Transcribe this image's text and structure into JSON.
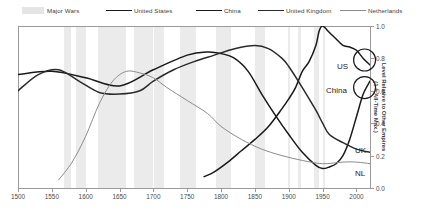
{
  "legend": {
    "items": [
      {
        "label": "Major Wars",
        "kind": "band",
        "color": "#e5e5e5"
      },
      {
        "label": "United States",
        "kind": "line",
        "color": "#1a1a1a",
        "width": 1.6
      },
      {
        "label": "China",
        "kind": "line",
        "color": "#1a1a1a",
        "width": 1.3
      },
      {
        "label": "United Kingdom",
        "kind": "line",
        "color": "#2b2b2b",
        "width": 1.4
      },
      {
        "label": "Netherlands",
        "kind": "line",
        "color": "#8c8c8c",
        "width": 1.0
      }
    ]
  },
  "axes": {
    "x_ticks": [
      "1500",
      "1550",
      "1600",
      "1650",
      "1700",
      "1750",
      "1800",
      "1850",
      "1900",
      "1950",
      "2000"
    ],
    "y_ticks": [
      "0.0",
      "0.2",
      "0.4",
      "0.6",
      "0.8",
      "1.0"
    ],
    "y_title_line1": "Level Relative to Other Empires",
    "y_title_line2": "(1 = All-Time Max.)"
  },
  "end_labels": [
    {
      "name": "US",
      "text": "US"
    },
    {
      "name": "China",
      "text": "China"
    },
    {
      "name": "UK",
      "text": "UK"
    },
    {
      "name": "NL",
      "text": "NL"
    }
  ],
  "chart_data": {
    "type": "line",
    "title": "",
    "xlabel": "",
    "ylabel": "Level Relative to Other Empires (1 = All-Time Max.)",
    "xlim": [
      1500,
      2020
    ],
    "ylim": [
      0.0,
      1.0
    ],
    "grid": false,
    "legend_position": "top",
    "shaded_bands": {
      "label": "Major Wars",
      "color": "#ebebeb",
      "ranges": [
        [
          1568,
          1578
        ],
        [
          1585,
          1600
        ],
        [
          1618,
          1660
        ],
        [
          1672,
          1700
        ],
        [
          1701,
          1715
        ],
        [
          1740,
          1763
        ],
        [
          1792,
          1815
        ],
        [
          1850,
          1865
        ],
        [
          1899,
          1902
        ],
        [
          1914,
          1918
        ],
        [
          1937,
          1945
        ],
        [
          1950,
          1953
        ]
      ]
    },
    "series": [
      {
        "name": "United States",
        "color": "#1a1a1a",
        "x": [
          1775,
          1790,
          1810,
          1830,
          1850,
          1870,
          1890,
          1900,
          1910,
          1920,
          1930,
          1940,
          1945,
          1950,
          1960,
          1970,
          1980,
          1990,
          2000,
          2010,
          2020
        ],
        "y": [
          0.07,
          0.1,
          0.16,
          0.23,
          0.3,
          0.38,
          0.49,
          0.55,
          0.62,
          0.72,
          0.78,
          0.88,
          0.97,
          1.0,
          0.96,
          0.92,
          0.88,
          0.87,
          0.85,
          0.8,
          0.76
        ]
      },
      {
        "name": "China",
        "color": "#1a1a1a",
        "x": [
          1500,
          1550,
          1600,
          1650,
          1700,
          1750,
          1780,
          1800,
          1820,
          1840,
          1860,
          1880,
          1900,
          1920,
          1940,
          1950,
          1960,
          1970,
          1980,
          1990,
          2000,
          2010,
          2020
        ],
        "y": [
          0.7,
          0.72,
          0.68,
          0.63,
          0.73,
          0.82,
          0.84,
          0.83,
          0.8,
          0.72,
          0.58,
          0.45,
          0.33,
          0.22,
          0.14,
          0.12,
          0.13,
          0.15,
          0.2,
          0.3,
          0.44,
          0.58,
          0.66
        ]
      },
      {
        "name": "United Kingdom",
        "color": "#2b2b2b",
        "x": [
          1500,
          1530,
          1560,
          1590,
          1620,
          1650,
          1680,
          1700,
          1730,
          1760,
          1790,
          1820,
          1850,
          1870,
          1890,
          1900,
          1920,
          1940,
          1950,
          1960,
          1980,
          2000,
          2020
        ],
        "y": [
          0.6,
          0.7,
          0.73,
          0.66,
          0.59,
          0.58,
          0.6,
          0.66,
          0.73,
          0.78,
          0.82,
          0.86,
          0.88,
          0.86,
          0.8,
          0.75,
          0.62,
          0.48,
          0.4,
          0.33,
          0.28,
          0.24,
          0.22
        ]
      },
      {
        "name": "Netherlands",
        "color": "#8c8c8c",
        "x": [
          1560,
          1580,
          1600,
          1620,
          1640,
          1660,
          1680,
          1700,
          1720,
          1750,
          1780,
          1800,
          1830,
          1860,
          1890,
          1920,
          1950,
          1980,
          2000,
          2020
        ],
        "y": [
          0.05,
          0.16,
          0.32,
          0.52,
          0.66,
          0.72,
          0.71,
          0.68,
          0.62,
          0.54,
          0.46,
          0.38,
          0.3,
          0.24,
          0.2,
          0.17,
          0.15,
          0.16,
          0.16,
          0.15
        ]
      }
    ],
    "annotations": [
      {
        "text": "US",
        "x": 2012,
        "y": 0.79,
        "marker": "circle"
      },
      {
        "text": "China",
        "x": 2012,
        "y": 0.62,
        "marker": "circle"
      },
      {
        "text": "UK",
        "x": 2012,
        "y": 0.26,
        "marker": "none"
      },
      {
        "text": "NL",
        "x": 2012,
        "y": 0.13,
        "marker": "none"
      }
    ]
  }
}
